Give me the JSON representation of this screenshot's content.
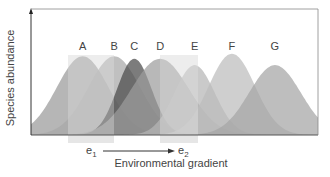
{
  "chart_data": {
    "type": "area",
    "title": "",
    "xlabel": "Environmental gradient",
    "ylabel": "Species abundance",
    "gradient_start_label": "e1",
    "gradient_end_label": "e2",
    "grid": false,
    "legend": "none (species labelled above peaks)",
    "x_range": [
      0,
      100
    ],
    "y_range": [
      0,
      100
    ],
    "series": [
      {
        "name": "A",
        "peak_x": 18,
        "peak_y": 62,
        "width": 9,
        "color": "#9a9a9a"
      },
      {
        "name": "B",
        "peak_x": 29,
        "peak_y": 62,
        "width": 9,
        "color": "#a8a8a8"
      },
      {
        "name": "C",
        "peak_x": 36,
        "peak_y": 60,
        "width": 6,
        "color": "#4a4a4a"
      },
      {
        "name": "D",
        "peak_x": 45,
        "peak_y": 60,
        "width": 10,
        "color": "#9c9c9c"
      },
      {
        "name": "E",
        "peak_x": 57,
        "peak_y": 55,
        "width": 7,
        "color": "#b5b5b5"
      },
      {
        "name": "F",
        "peak_x": 70,
        "peak_y": 64,
        "width": 8,
        "color": "#bdbdbd"
      },
      {
        "name": "G",
        "peak_x": 85,
        "peak_y": 55,
        "width": 9,
        "color": "#a5a5a5"
      }
    ],
    "highlight_bands": [
      {
        "label": "e1",
        "x_start": 13,
        "x_end": 29
      },
      {
        "label": "e2",
        "x_start": 45,
        "x_end": 58
      }
    ]
  },
  "labels": {
    "ylabel": "Species abundance",
    "xlabel": "Environmental gradient",
    "e1": "e",
    "e1_sub": "1",
    "e2": "e",
    "e2_sub": "2",
    "species": [
      "A",
      "B",
      "C",
      "D",
      "E",
      "F",
      "G"
    ]
  }
}
